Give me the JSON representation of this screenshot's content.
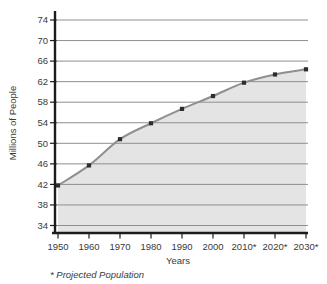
{
  "chart_data": {
    "type": "area",
    "title": "",
    "categories": [
      "1950",
      "1960",
      "1970",
      "1980",
      "1990",
      "2000",
      "2010*",
      "2020*",
      "2030*"
    ],
    "values": [
      41.8,
      45.7,
      50.8,
      53.9,
      56.7,
      59.2,
      61.8,
      63.4,
      64.4
    ],
    "projected_from_category": "2010*",
    "xlabel": "Years",
    "ylabel": "Millions of People",
    "ylim": [
      34,
      74
    ],
    "y_ticks": [
      34,
      38,
      42,
      46,
      50,
      54,
      58,
      62,
      66,
      70,
      74
    ],
    "grid": true,
    "legend": "none",
    "footnote": "* Projected Population",
    "colors": {
      "area_fill": "#e4e4e4",
      "line": "#8f8f8f",
      "marker": "#2d2d2d",
      "grid": "#8f8f8f",
      "axis": "#1c1c1c",
      "text": "#3a3a3a"
    }
  }
}
